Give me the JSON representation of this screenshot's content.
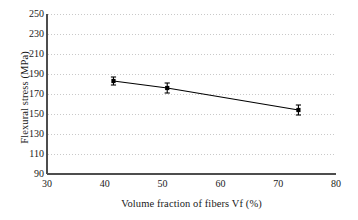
{
  "chart_data": {
    "type": "scatter",
    "title": "",
    "xlabel": "Volume fraction of fibers Vf (%)",
    "ylabel": "Flexural stress (MPa)",
    "xlim": [
      30,
      80
    ],
    "ylim": [
      90,
      250
    ],
    "xticks": [
      30,
      40,
      50,
      60,
      70,
      80
    ],
    "yticks": [
      90,
      110,
      130,
      150,
      170,
      190,
      210,
      230,
      250
    ],
    "grid": "horizontal-dotted",
    "legend": "none",
    "series": [
      {
        "name": "Flexural stress vs fiber volume fraction",
        "marker": "square",
        "line": "solid-black",
        "x": [
          41.5,
          50.8,
          73.5
        ],
        "y": [
          183,
          176,
          154
        ],
        "yerr": [
          4,
          5,
          5
        ]
      }
    ],
    "points": [
      {
        "x": 41.5,
        "y": 183,
        "yerr": 4
      },
      {
        "x": 50.8,
        "y": 176,
        "yerr": 5
      },
      {
        "x": 73.5,
        "y": 154,
        "yerr": 5
      }
    ],
    "colors": {
      "line": "#000000",
      "marker": "#000000",
      "grid": "#c9c9c9",
      "axis": "#4d4d4d",
      "text": "#1a1a1a",
      "background": "#ffffff"
    }
  }
}
